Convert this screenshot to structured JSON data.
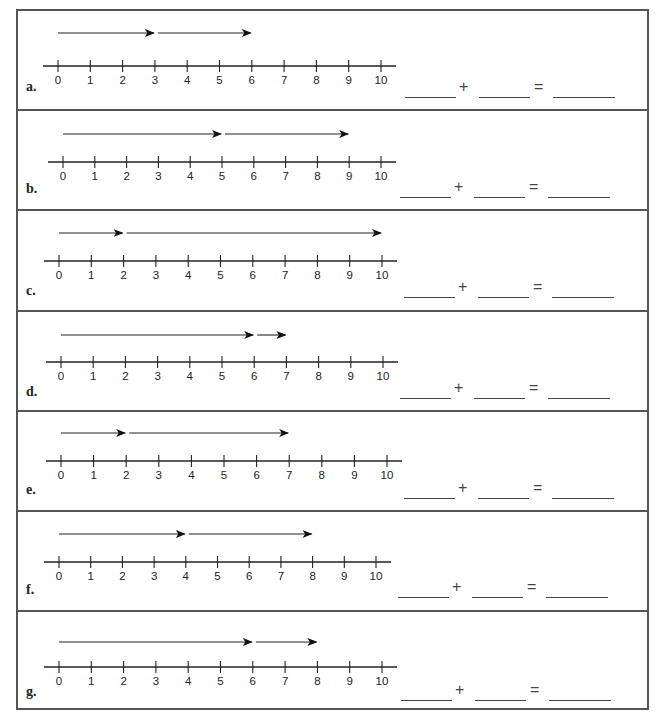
{
  "worksheet": {
    "number_line": {
      "min": 0,
      "max": 10,
      "ticks": [
        "0",
        "1",
        "2",
        "3",
        "4",
        "5",
        "6",
        "7",
        "8",
        "9",
        "10"
      ]
    },
    "equation": {
      "plus": "+",
      "equals": "="
    },
    "problems": [
      {
        "label": "a.",
        "jumps": [
          [
            0,
            3
          ],
          [
            3,
            6
          ]
        ]
      },
      {
        "label": "b.",
        "jumps": [
          [
            0,
            5
          ],
          [
            5,
            9
          ]
        ]
      },
      {
        "label": "c.",
        "jumps": [
          [
            0,
            2
          ],
          [
            2,
            10
          ]
        ]
      },
      {
        "label": "d.",
        "jumps": [
          [
            0,
            6
          ],
          [
            6,
            7
          ]
        ]
      },
      {
        "label": "e.",
        "jumps": [
          [
            0,
            2
          ],
          [
            2,
            7
          ]
        ]
      },
      {
        "label": "f.",
        "jumps": [
          [
            0,
            4
          ],
          [
            4,
            8
          ]
        ]
      },
      {
        "label": "g.",
        "jumps": [
          [
            0,
            6
          ],
          [
            6,
            8
          ]
        ]
      }
    ]
  }
}
